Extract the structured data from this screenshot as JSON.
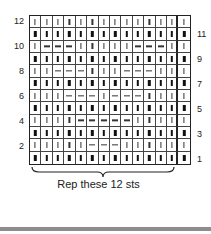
{
  "chart_data": {
    "type": "table",
    "columns": 14,
    "repeat_columns": 12,
    "legend": {
      "|": "knit",
      "-": "purl"
    },
    "rows_top_to_bottom": [
      {
        "row": 12,
        "side": "left",
        "cells": [
          "|",
          "|",
          "|",
          "|",
          "|",
          "|",
          "|",
          "|",
          "|",
          "|",
          "|",
          "|",
          "|",
          "|"
        ]
      },
      {
        "row": 11,
        "side": "right",
        "cells": [
          "|",
          "|",
          "|",
          "|",
          "|",
          "|",
          "|",
          "|",
          "|",
          "|",
          "|",
          "|",
          "|",
          "|"
        ]
      },
      {
        "row": 10,
        "side": "left",
        "cells": [
          "|",
          "-",
          "-",
          "-",
          "|",
          "|",
          "|",
          "|",
          "|",
          "-",
          "-",
          "-",
          "|",
          "|"
        ]
      },
      {
        "row": 9,
        "side": "right",
        "cells": [
          "|",
          "|",
          "|",
          "|",
          "|",
          "|",
          "|",
          "|",
          "|",
          "|",
          "|",
          "|",
          "|",
          "|"
        ]
      },
      {
        "row": 8,
        "side": "left",
        "cells": [
          "|",
          "|",
          "-",
          "-",
          "-",
          "|",
          "|",
          "|",
          "-",
          "-",
          "-",
          "|",
          "|",
          "|"
        ]
      },
      {
        "row": 7,
        "side": "right",
        "cells": [
          "|",
          "|",
          "|",
          "|",
          "|",
          "|",
          "|",
          "|",
          "|",
          "|",
          "|",
          "|",
          "|",
          "|"
        ]
      },
      {
        "row": 6,
        "side": "left",
        "cells": [
          "|",
          "|",
          "|",
          "-",
          "-",
          "-",
          "|",
          "-",
          "-",
          "-",
          "|",
          "|",
          "|",
          "|"
        ]
      },
      {
        "row": 5,
        "side": "right",
        "cells": [
          "|",
          "|",
          "|",
          "|",
          "|",
          "|",
          "|",
          "|",
          "|",
          "|",
          "|",
          "|",
          "|",
          "|"
        ]
      },
      {
        "row": 4,
        "side": "left",
        "cells": [
          "|",
          "|",
          "|",
          "|",
          "-",
          "-",
          "-",
          "-",
          "-",
          "|",
          "|",
          "|",
          "|",
          "|"
        ]
      },
      {
        "row": 3,
        "side": "right",
        "cells": [
          "|",
          "|",
          "|",
          "|",
          "|",
          "|",
          "|",
          "|",
          "|",
          "|",
          "|",
          "|",
          "|",
          "|"
        ]
      },
      {
        "row": 2,
        "side": "left",
        "cells": [
          "|",
          "|",
          "|",
          "|",
          "|",
          "-",
          "-",
          "-",
          "|",
          "|",
          "|",
          "|",
          "|",
          "|"
        ]
      },
      {
        "row": 1,
        "side": "right",
        "cells": [
          "|",
          "|",
          "|",
          "|",
          "|",
          "|",
          "|",
          "|",
          "|",
          "|",
          "|",
          "|",
          "|",
          "|"
        ]
      }
    ],
    "annotations": [
      "Rep these 12 sts"
    ]
  },
  "labels": {
    "left_row_numbers": [
      "12",
      "10",
      "8",
      "6",
      "4",
      "2"
    ],
    "right_row_numbers": [
      "11",
      "9",
      "7",
      "5",
      "3",
      "1"
    ],
    "repeat_label": "Rep these 12 sts"
  }
}
